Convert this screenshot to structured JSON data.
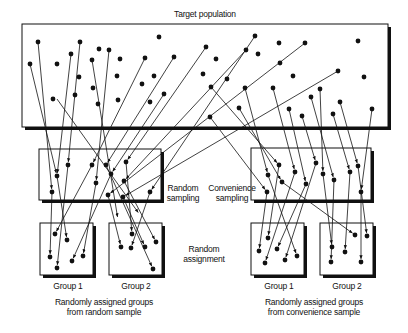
{
  "title": "Target population",
  "labels": {
    "random_sampling": [
      "Random",
      "sampling"
    ],
    "convenience_sampling": [
      "Convenience",
      "sampling"
    ],
    "random_assignment": [
      "Random",
      "assignment"
    ],
    "group1_left": "Group 1",
    "group2_left": "Group 2",
    "group1_right": "Group 1",
    "group2_right": "Group 2",
    "caption_left": [
      "Randomly assigned groups",
      "from random sample"
    ],
    "caption_right": [
      "Randomly assigned groups",
      "from convenience sample"
    ]
  },
  "colors": {
    "ink": "#111111",
    "background": "#ffffff"
  },
  "boxes": {
    "population": [
      22,
      24,
      366,
      103
    ],
    "random_sample": [
      39,
      149,
      122,
      51
    ],
    "convenience_sample": [
      251,
      148,
      120,
      52
    ],
    "random_group1": [
      40,
      223,
      53,
      52
    ],
    "random_group2": [
      109,
      223,
      53,
      52
    ],
    "convenience_group1": [
      251,
      223,
      53,
      52
    ],
    "convenience_group2": [
      320,
      223,
      53,
      52
    ]
  },
  "population_dots": [
    [
      38,
      42
    ],
    [
      80,
      42
    ],
    [
      159,
      37
    ],
    [
      255,
      36
    ],
    [
      279,
      43
    ],
    [
      305,
      43
    ],
    [
      358,
      41
    ],
    [
      30,
      64
    ],
    [
      57,
      64
    ],
    [
      71,
      54
    ],
    [
      99,
      49
    ],
    [
      109,
      50
    ],
    [
      92,
      60
    ],
    [
      120,
      59
    ],
    [
      145,
      58
    ],
    [
      174,
      57
    ],
    [
      206,
      47
    ],
    [
      246,
      50
    ],
    [
      216,
      59
    ],
    [
      258,
      54
    ],
    [
      79,
      77
    ],
    [
      93,
      88
    ],
    [
      117,
      76
    ],
    [
      142,
      84
    ],
    [
      154,
      76
    ],
    [
      203,
      74
    ],
    [
      227,
      79
    ],
    [
      280,
      63
    ],
    [
      293,
      76
    ],
    [
      338,
      71
    ],
    [
      364,
      77
    ],
    [
      53,
      99
    ],
    [
      75,
      95
    ],
    [
      98,
      104
    ],
    [
      118,
      100
    ],
    [
      150,
      102
    ],
    [
      164,
      94
    ],
    [
      211,
      87
    ],
    [
      245,
      88
    ],
    [
      273,
      88
    ],
    [
      320,
      89
    ],
    [
      311,
      97
    ],
    [
      340,
      102
    ],
    [
      372,
      109
    ],
    [
      239,
      108
    ],
    [
      289,
      109
    ],
    [
      302,
      116
    ],
    [
      333,
      114
    ],
    [
      210,
      117
    ]
  ],
  "random_sample_dots": [
    [
      52,
      192
    ],
    [
      57,
      176
    ],
    [
      68,
      165
    ],
    [
      92,
      165
    ],
    [
      96,
      183
    ],
    [
      106,
      165
    ],
    [
      111,
      174
    ],
    [
      126,
      162
    ],
    [
      124,
      181
    ],
    [
      108,
      195
    ],
    [
      123,
      197
    ],
    [
      150,
      192
    ]
  ],
  "convenience_sample_dots": [
    [
      267,
      192
    ],
    [
      268,
      175
    ],
    [
      279,
      165
    ],
    [
      282,
      182
    ],
    [
      295,
      172
    ],
    [
      306,
      184
    ],
    [
      316,
      163
    ],
    [
      323,
      174
    ],
    [
      334,
      180
    ],
    [
      350,
      172
    ],
    [
      358,
      166
    ],
    [
      361,
      192
    ]
  ],
  "random_group1_dots": [
    [
      55,
      234
    ],
    [
      67,
      240
    ],
    [
      50,
      257
    ],
    [
      57,
      268
    ],
    [
      72,
      261
    ],
    [
      83,
      256
    ]
  ],
  "random_group2_dots": [
    [
      132,
      234
    ],
    [
      156,
      242
    ],
    [
      121,
      247
    ],
    [
      131,
      248
    ],
    [
      145,
      247
    ],
    [
      153,
      269
    ]
  ],
  "convenience_group1_dots": [
    [
      268,
      238
    ],
    [
      259,
      251
    ],
    [
      277,
      249
    ],
    [
      265,
      263
    ],
    [
      285,
      260
    ],
    [
      297,
      256
    ]
  ],
  "convenience_group2_dots": [
    [
      355,
      235
    ],
    [
      367,
      236
    ],
    [
      332,
      247
    ],
    [
      345,
      252
    ],
    [
      331,
      262
    ],
    [
      361,
      262
    ]
  ],
  "arrows_top": [
    [
      38,
      42,
      52,
      192
    ],
    [
      30,
      64,
      57,
      176
    ],
    [
      80,
      42,
      68,
      165
    ],
    [
      71,
      54,
      57,
      176
    ],
    [
      145,
      58,
      92,
      165
    ],
    [
      109,
      50,
      96,
      183
    ],
    [
      174,
      57,
      106,
      165
    ],
    [
      164,
      94,
      111,
      174
    ],
    [
      206,
      47,
      126,
      162
    ],
    [
      246,
      50,
      124,
      181
    ],
    [
      305,
      43,
      108,
      195
    ],
    [
      338,
      71,
      123,
      197
    ],
    [
      255,
      36,
      150,
      192
    ],
    [
      210,
      117,
      267,
      192
    ],
    [
      245,
      88,
      268,
      175
    ],
    [
      211,
      87,
      279,
      165
    ],
    [
      239,
      108,
      282,
      182
    ],
    [
      273,
      88,
      295,
      172
    ],
    [
      289,
      109,
      306,
      184
    ],
    [
      302,
      116,
      316,
      163
    ],
    [
      320,
      89,
      323,
      174
    ],
    [
      311,
      97,
      334,
      180
    ],
    [
      333,
      114,
      350,
      172
    ],
    [
      340,
      102,
      358,
      166
    ],
    [
      372,
      109,
      361,
      192
    ],
    [
      57,
      99,
      140,
      215
    ],
    [
      92,
      60,
      118,
      220
    ]
  ],
  "arrows_bottom": [
    [
      52,
      192,
      50,
      257
    ],
    [
      57,
      176,
      67,
      240
    ],
    [
      68,
      165,
      57,
      268
    ],
    [
      92,
      165,
      55,
      234
    ],
    [
      96,
      183,
      83,
      256
    ],
    [
      111,
      174,
      72,
      261
    ],
    [
      126,
      162,
      132,
      234
    ],
    [
      124,
      181,
      156,
      242
    ],
    [
      108,
      195,
      121,
      247
    ],
    [
      123,
      197,
      145,
      247
    ],
    [
      150,
      192,
      131,
      248
    ],
    [
      106,
      165,
      153,
      269
    ],
    [
      267,
      192,
      259,
      251
    ],
    [
      268,
      175,
      297,
      256
    ],
    [
      279,
      165,
      268,
      238
    ],
    [
      282,
      182,
      355,
      235
    ],
    [
      295,
      172,
      265,
      263
    ],
    [
      306,
      184,
      277,
      249
    ],
    [
      316,
      163,
      285,
      260
    ],
    [
      323,
      174,
      332,
      247
    ],
    [
      334,
      180,
      331,
      262
    ],
    [
      350,
      172,
      345,
      252
    ],
    [
      358,
      166,
      367,
      236
    ],
    [
      361,
      192,
      361,
      262
    ]
  ]
}
